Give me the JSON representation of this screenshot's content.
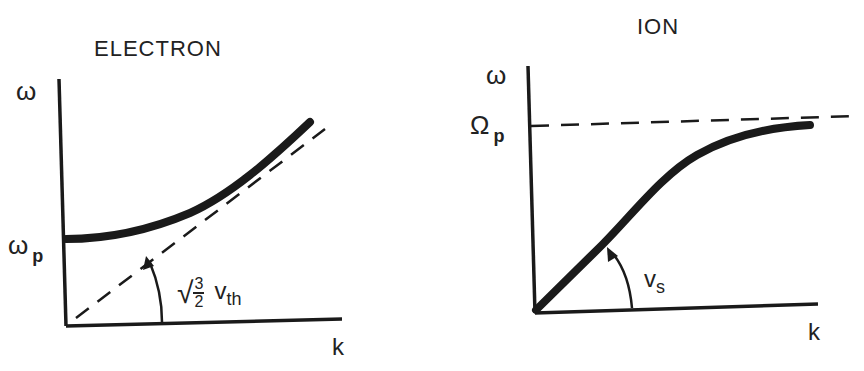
{
  "electron": {
    "title": "ELECTRON",
    "y_axis_label": "ω",
    "y_tick_label": "ω",
    "y_tick_sub": "p",
    "x_axis_label": "k",
    "annotation": {
      "sqrt": "√",
      "frac_num": "3",
      "frac_den": "2",
      "v": "v",
      "v_sub": "th"
    },
    "curve": "solid thick curve starting at ω_p on the ω axis, rising and asymptotically approaching dashed line",
    "asymptote": "dashed line through origin with slope √(3/2) v_th"
  },
  "ion": {
    "title": "ION",
    "y_axis_label": "ω",
    "y_tick_label": "Ω",
    "y_tick_sub": "p",
    "x_axis_label": "k",
    "annotation": {
      "v": "v",
      "v_sub": "s"
    },
    "curve": "solid thick curve starting at origin with slope v_s, saturating toward Ω_p",
    "asymptote": "horizontal dashed line at Ω_p"
  },
  "colors": {
    "ink": "#1a1a1a",
    "background": "#ffffff"
  }
}
